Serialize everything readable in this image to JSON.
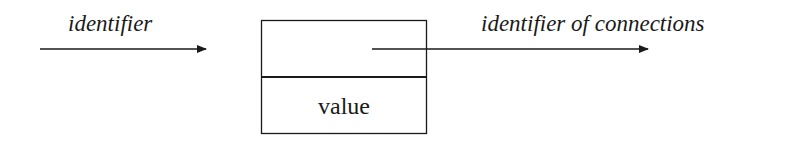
{
  "diagram": {
    "input_label": "identifier",
    "output_label": "identifier of connections",
    "box": {
      "top_cell": "",
      "bottom_cell": "value"
    },
    "colors": {
      "stroke": "#1a1a1a",
      "background": "#ffffff"
    }
  }
}
